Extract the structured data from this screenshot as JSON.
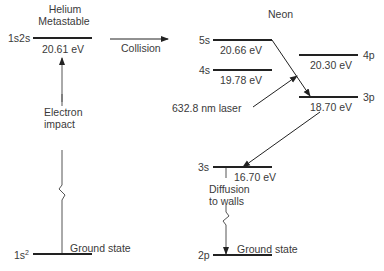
{
  "helium": {
    "title_line1": "Helium",
    "title_line2": "Metastable",
    "metastable_state": "1s2s",
    "metastable_energy": "20.61 eV",
    "ground_state_config": "1s",
    "ground_state_sup": "2",
    "ground_state_label": "Ground state",
    "excitation_label_line1": "Electron",
    "excitation_label_line2": "impact"
  },
  "transfer": {
    "label": "Collision"
  },
  "neon": {
    "title": "Neon",
    "levels": [
      {
        "state": "5s",
        "energy": "20.66 eV"
      },
      {
        "state": "4s",
        "energy": "19.78 eV"
      },
      {
        "state": "4p",
        "energy": "20.30 eV"
      },
      {
        "state": "3p",
        "energy": "18.70 eV"
      },
      {
        "state": "3s",
        "energy": "16.70 eV"
      },
      {
        "state": "2p",
        "label": "Ground state"
      }
    ],
    "laser_label": "632.8 nm laser",
    "diffusion_line1": "Diffusion",
    "diffusion_line2": "to walls"
  },
  "colors": {
    "line": "#222222",
    "text": "#3a3a3a"
  }
}
